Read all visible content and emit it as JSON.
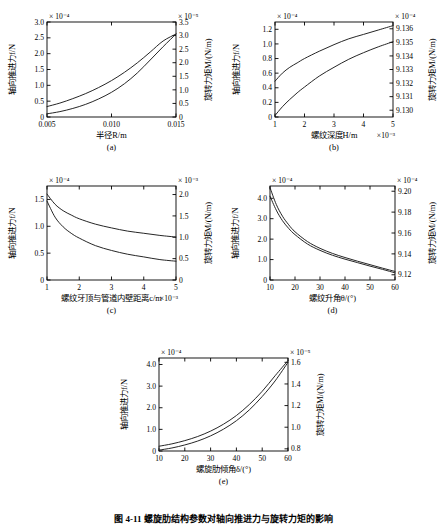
{
  "figure": {
    "caption": "图 4-11  螺旋肋结构参数对轴向推进力与旋转力矩的影响",
    "subplot_tags": {
      "a": "(a)",
      "b": "(b)",
      "c": "(c)",
      "d": "(d)",
      "e": "(e)"
    },
    "common": {
      "ylabel_left": "轴向推进力f/N",
      "ylabel_left_sub": "z",
      "ylabel_right": "旋转力矩M/(N/m)",
      "ylabel_right_sub": "z"
    }
  },
  "chart_data": [
    {
      "id": "a",
      "type": "line",
      "title": "",
      "tag": "(a)",
      "xlabel": "半径R/m",
      "xlabel_exp": "",
      "ylabel": "轴向推进力f/N",
      "ylabel_right": "旋转力矩M/(N/m)",
      "left_exp": "× 10⁻⁴",
      "right_exp": "× 10⁻⁵",
      "xlim": [
        0.005,
        0.015
      ],
      "xticks": [
        0.005,
        0.01,
        0.015
      ],
      "xticklabels": [
        "0.005",
        "0.010",
        "0.015"
      ],
      "ylim_left": [
        0,
        3.0
      ],
      "yticks_left": [
        0,
        0.5,
        1.0,
        1.5,
        2.0,
        2.5,
        3.0
      ],
      "yticklabels_left": [
        "0",
        "0.5",
        "1.0",
        "1.5",
        "2.0",
        "2.5",
        "3.0"
      ],
      "ylim_right": [
        0,
        3.5
      ],
      "yticks_right": [
        0,
        0.5,
        1.0,
        1.5,
        2.0,
        2.5,
        3.0,
        3.5
      ],
      "yticklabels_right": [
        "0",
        "0.5",
        "1.0",
        "1.5",
        "2.0",
        "2.5",
        "3.0",
        "3.5"
      ],
      "series": [
        {
          "name": "axial-force",
          "x": [
            0.005,
            0.006,
            0.007,
            0.008,
            0.009,
            0.01,
            0.011,
            0.012,
            0.013,
            0.014,
            0.015
          ],
          "y": [
            0.33,
            0.44,
            0.58,
            0.74,
            0.93,
            1.15,
            1.41,
            1.71,
            2.05,
            2.4,
            2.62
          ]
        },
        {
          "name": "rotation-torque",
          "x": [
            0.005,
            0.006,
            0.007,
            0.008,
            0.009,
            0.01,
            0.011,
            0.012,
            0.013,
            0.014,
            0.015
          ],
          "y": [
            0.1,
            0.17,
            0.27,
            0.4,
            0.57,
            0.78,
            1.05,
            1.39,
            1.8,
            2.22,
            2.62
          ]
        }
      ]
    },
    {
      "id": "b",
      "type": "line",
      "tag": "(b)",
      "xlabel": "螺纹深度H/m",
      "xlabel_exp": "×10⁻³",
      "ylabel": "轴向推进力f/N",
      "ylabel_right": "旋转力矩M/(N/m)",
      "left_exp": "× 10⁻⁴",
      "right_exp": "× 10⁻⁴",
      "xlim": [
        1,
        5
      ],
      "xticks": [
        1,
        2,
        3,
        4,
        5
      ],
      "xticklabels": [
        "1",
        "2",
        "3",
        "4",
        "5"
      ],
      "ylim_left": [
        0,
        1.3
      ],
      "yticks_left": [
        0,
        0.2,
        0.4,
        0.6,
        0.8,
        1.0,
        1.2
      ],
      "yticklabels_left": [
        "0",
        "0.2",
        "0.4",
        "0.6",
        "0.8",
        "1.0",
        "1.2"
      ],
      "ylim_right": [
        9.1295,
        9.1365
      ],
      "yticks_right": [
        9.13,
        9.131,
        9.132,
        9.133,
        9.134,
        9.135,
        9.136
      ],
      "yticklabels_right": [
        "9.130",
        "9.131",
        "9.132",
        "9.133",
        "9.134",
        "9.135",
        "9.136"
      ],
      "series": [
        {
          "name": "axial-force",
          "x": [
            1,
            1.25,
            1.5,
            1.75,
            2,
            2.5,
            3,
            3.5,
            4,
            4.5,
            5
          ],
          "y": [
            0.49,
            0.6,
            0.68,
            0.74,
            0.8,
            0.9,
            0.99,
            1.07,
            1.13,
            1.19,
            1.25
          ]
        },
        {
          "name": "rotation-torque",
          "x": [
            1,
            1.25,
            1.5,
            1.75,
            2,
            2.5,
            3,
            3.5,
            4,
            4.5,
            5
          ],
          "y": [
            0.02,
            0.14,
            0.24,
            0.33,
            0.41,
            0.56,
            0.68,
            0.79,
            0.88,
            0.96,
            1.03
          ]
        }
      ]
    },
    {
      "id": "c",
      "type": "line",
      "tag": "(c)",
      "xlabel": "螺纹牙顶与管道内壁距离c/m",
      "xlabel_exp": "×10⁻³",
      "ylabel": "轴向推进力f/N",
      "ylabel_right": "旋转力矩M/(N/m)",
      "left_exp": "× 10⁻⁴",
      "right_exp": "× 10⁻³",
      "xlim": [
        1,
        5
      ],
      "xticks": [
        1,
        2,
        3,
        4,
        5
      ],
      "xticklabels": [
        "1",
        "2",
        "3",
        "4",
        "5"
      ],
      "ylim_left": [
        0,
        1.75
      ],
      "yticks_left": [
        0,
        0.5,
        1.0,
        1.5
      ],
      "yticklabels_left": [
        "0",
        "0.5",
        "1.0",
        "1.5"
      ],
      "ylim_right": [
        0,
        2.2
      ],
      "yticks_right": [
        0,
        0.5,
        1.0,
        1.5,
        2.0
      ],
      "yticklabels_right": [
        "0",
        "0.5",
        "1.0",
        "1.5",
        "2.0"
      ],
      "series": [
        {
          "name": "axial-force",
          "x": [
            1,
            1.25,
            1.5,
            1.75,
            2,
            2.5,
            3,
            3.5,
            4,
            4.5,
            5
          ],
          "y": [
            1.6,
            1.41,
            1.29,
            1.21,
            1.14,
            1.04,
            0.97,
            0.91,
            0.87,
            0.83,
            0.8
          ]
        },
        {
          "name": "rotation-torque",
          "x": [
            1,
            1.25,
            1.5,
            1.75,
            2,
            2.5,
            3,
            3.5,
            4,
            4.5,
            5
          ],
          "y": [
            1.47,
            1.17,
            0.99,
            0.87,
            0.78,
            0.64,
            0.55,
            0.48,
            0.43,
            0.38,
            0.35
          ]
        }
      ]
    },
    {
      "id": "d",
      "type": "line",
      "tag": "(d)",
      "xlabel": "螺纹升角θ/(°)",
      "xlabel_exp": "",
      "ylabel": "轴向推进力f/N",
      "ylabel_right": "旋转力矩M/(N/m)",
      "left_exp": "× 10⁻⁴",
      "right_exp": "× 10⁻⁴",
      "xlim": [
        10,
        60
      ],
      "xticks": [
        10,
        20,
        30,
        40,
        50,
        60
      ],
      "xticklabels": [
        "10",
        "20",
        "30",
        "40",
        "50",
        "60"
      ],
      "ylim_left": [
        0,
        4.6
      ],
      "yticks_left": [
        0,
        1.0,
        2.0,
        3.0,
        4.0
      ],
      "yticklabels_left": [
        "0",
        "1.0",
        "2.0",
        "3.0",
        "4.0"
      ],
      "ylim_right": [
        9.115,
        9.205
      ],
      "yticks_right": [
        9.12,
        9.14,
        9.16,
        9.18,
        9.2
      ],
      "yticklabels_right": [
        "9.12",
        "9.14",
        "9.16",
        "9.18",
        "9.20"
      ],
      "series": [
        {
          "name": "axial-force",
          "x": [
            10,
            12.5,
            15,
            17.5,
            20,
            25,
            30,
            35,
            40,
            45,
            50,
            55,
            60
          ],
          "y": [
            4.52,
            3.7,
            3.12,
            2.7,
            2.36,
            1.88,
            1.55,
            1.3,
            1.1,
            0.92,
            0.75,
            0.58,
            0.42
          ]
        },
        {
          "name": "rotation-torque",
          "x": [
            10,
            12.5,
            15,
            17.5,
            20,
            25,
            30,
            35,
            40,
            45,
            50,
            55,
            60
          ],
          "y": [
            4.1,
            3.42,
            2.9,
            2.52,
            2.22,
            1.76,
            1.45,
            1.21,
            1.02,
            0.85,
            0.68,
            0.52,
            0.35
          ]
        }
      ]
    },
    {
      "id": "e",
      "type": "line",
      "tag": "(e)",
      "xlabel": "螺旋肋倾角δ/(°)",
      "xlabel_exp": "",
      "ylabel": "轴向推进力f/N",
      "ylabel_right": "旋转力矩M/(N/m)",
      "left_exp": "× 10⁻⁴",
      "right_exp": "× 10⁻⁵",
      "xlim": [
        10,
        60
      ],
      "xticks": [
        10,
        20,
        30,
        40,
        50,
        60
      ],
      "xticklabels": [
        "10",
        "20",
        "30",
        "40",
        "50",
        "60"
      ],
      "ylim_left": [
        0,
        4.3
      ],
      "yticks_left": [
        0,
        1.0,
        2.0,
        3.0,
        4.0
      ],
      "yticklabels_left": [
        "0",
        "1.0",
        "2.0",
        "3.0",
        "4.0"
      ],
      "ylim_right": [
        0.78,
        1.64
      ],
      "yticks_right": [
        0.8,
        1.0,
        1.2,
        1.4,
        1.6
      ],
      "yticklabels_right": [
        "0.8",
        "1.0",
        "1.2",
        "1.4",
        "1.6"
      ],
      "series": [
        {
          "name": "axial-force",
          "x": [
            10,
            15,
            20,
            25,
            30,
            35,
            40,
            45,
            50,
            55,
            60
          ],
          "y": [
            0.22,
            0.33,
            0.48,
            0.67,
            0.92,
            1.24,
            1.64,
            2.15,
            2.76,
            3.48,
            4.18
          ]
        },
        {
          "name": "rotation-torque",
          "x": [
            10,
            15,
            20,
            25,
            30,
            35,
            40,
            45,
            50,
            55,
            60
          ],
          "y": [
            0.04,
            0.14,
            0.28,
            0.46,
            0.7,
            1.01,
            1.4,
            1.9,
            2.52,
            3.24,
            4.1
          ]
        }
      ]
    }
  ],
  "style": {
    "axis_color": "#000000",
    "curve_color": "#1a1a1a",
    "background": "#ffffff"
  }
}
